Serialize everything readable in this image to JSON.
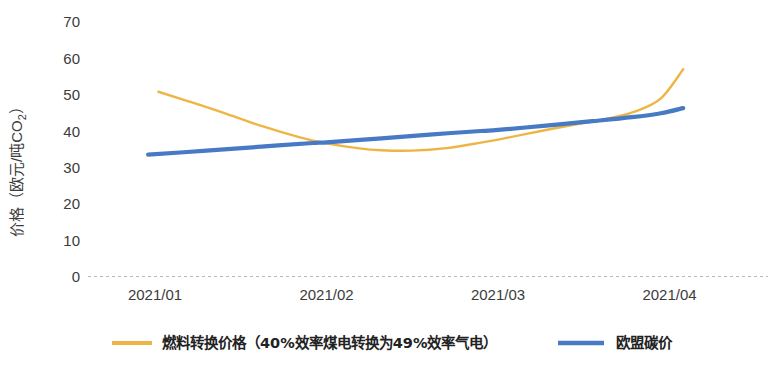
{
  "chart_data": {
    "type": "line",
    "title": "",
    "xlabel": "",
    "ylabel_parts": {
      "main": "价格（欧元/吨CO",
      "sub": "2",
      "tail": "）"
    },
    "ylabel": "价格（欧元/吨CO2）",
    "categories": [
      "2021/01",
      "2021/02",
      "2021/03",
      "2021/04"
    ],
    "x_tick_labels": [
      "2021/01",
      "2021/02",
      "2021/03",
      "2021/04"
    ],
    "y_tick_labels": [
      "0",
      "10",
      "20",
      "30",
      "40",
      "50",
      "60",
      "70"
    ],
    "y_ticks": [
      0,
      10,
      20,
      30,
      40,
      50,
      60,
      70
    ],
    "ylim": [
      0,
      72
    ],
    "xlim": [
      0,
      3.12
    ],
    "grid": false,
    "baseline_visible": true,
    "legend_position": "bottom",
    "series": [
      {
        "name": "燃料转换价格（40%效率煤电转换为49%效率气电）",
        "color": "#efb544",
        "x": [
          0.02,
          0.2,
          0.4,
          0.62,
          0.85,
          1.0,
          1.18,
          1.32,
          1.5,
          1.7,
          1.9,
          2.05,
          2.25,
          2.45,
          2.62,
          2.8,
          2.95,
          3.08
        ],
        "values": [
          50.8,
          48.1,
          45.0,
          41.4,
          38.2,
          36.6,
          35.3,
          34.7,
          34.6,
          35.3,
          36.8,
          38.1,
          40.0,
          41.8,
          43.2,
          45.4,
          49.0,
          57.0
        ]
      },
      {
        "name": "欧盟碳价",
        "color": "#4779c4",
        "x": [
          -0.04,
          0.3,
          0.62,
          0.92,
          1.0,
          1.32,
          1.62,
          1.9,
          2.0,
          2.28,
          2.55,
          2.78,
          2.95,
          3.08
        ],
        "values": [
          33.5,
          34.6,
          35.7,
          36.7,
          36.9,
          38.0,
          39.1,
          40.0,
          40.3,
          41.5,
          42.7,
          43.8,
          44.9,
          46.3
        ]
      }
    ],
    "colors": {
      "series_fuel_switch": "#efb544",
      "series_eu_carbon": "#4779c4",
      "axis_text": "#3c3c3c",
      "baseline": "#b9b9b9"
    }
  },
  "legend": {
    "items": [
      {
        "label": "燃料转换价格（40%效率煤电转换为49%效率气电）",
        "color": "#efb544"
      },
      {
        "label": "欧盟碳价",
        "color": "#4779c4"
      }
    ]
  }
}
